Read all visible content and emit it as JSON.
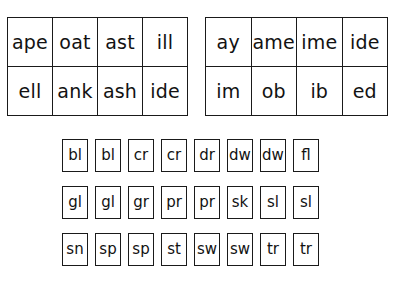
{
  "page": {
    "background_color": "#ffffff",
    "ink_color": "#121212"
  },
  "tables": [
    {
      "name": "rime-table-left",
      "rows": [
        [
          "ape",
          "oat",
          "ast",
          "ill"
        ],
        [
          "ell",
          "ank",
          "ash",
          "ide"
        ]
      ]
    },
    {
      "name": "rime-table-right",
      "rows": [
        [
          "ay",
          "ame",
          "ime",
          "ide"
        ],
        [
          "im",
          "ob",
          "ib",
          "ed"
        ]
      ]
    }
  ],
  "blend_grid": {
    "name": "consonant-blend-cards",
    "rows": [
      [
        "bl",
        "bl",
        "cr",
        "cr",
        "dr",
        "dw",
        "dw",
        "fl"
      ],
      [
        "gl",
        "gl",
        "gr",
        "pr",
        "pr",
        "sk",
        "sl",
        "sl"
      ],
      [
        "sn",
        "sp",
        "sp",
        "st",
        "sw",
        "sw",
        "tr",
        "tr"
      ]
    ]
  }
}
